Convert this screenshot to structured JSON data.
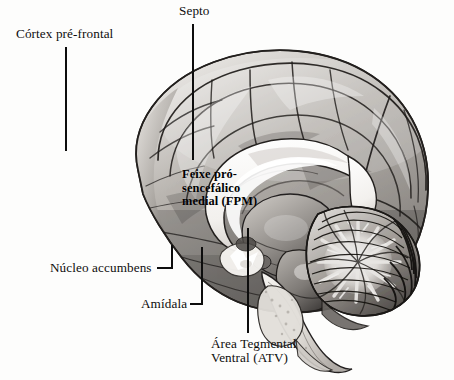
{
  "figure": {
    "type": "anatomical-illustration",
    "language": "pt-BR",
    "background_color": "#fdfdfc",
    "ink_color": "#0d0d0d",
    "style": "grayscale halftone engraving"
  },
  "annotations": [
    {
      "id": "cortex-pre-frontal",
      "text": "Córtex pré-frontal",
      "label_x": 16,
      "label_y": 27,
      "align": "left",
      "overlay": false,
      "leader": {
        "type": "vertical",
        "x": 66,
        "y1": 47,
        "y2": 151
      }
    },
    {
      "id": "septo",
      "text": "Septo",
      "label_x": 179,
      "label_y": 4,
      "align": "left",
      "overlay": false,
      "leader": {
        "type": "vertical",
        "x": 193,
        "y1": 24,
        "y2": 160
      }
    },
    {
      "id": "feixe-prosencefalico-medial",
      "text": "Feixe pró-\nsencefálico\nmedial (FPM)",
      "label_x": 182,
      "label_y": 168,
      "align": "left",
      "overlay": true,
      "leader": null
    },
    {
      "id": "nucleo-accumbens",
      "text": "Núcleo accumbens",
      "label_x": 50,
      "label_y": 261,
      "align": "left",
      "overlay": false,
      "leader": {
        "type": "elbow",
        "x1": 157,
        "y1": 268,
        "x2": 172,
        "y2": 268,
        "y3": 245
      }
    },
    {
      "id": "amidala",
      "text": "Amídala",
      "label_x": 141,
      "label_y": 297,
      "align": "left",
      "overlay": false,
      "leader": {
        "type": "elbow",
        "x1": 190,
        "y1": 304,
        "x2": 202,
        "y2": 304,
        "y3": 247
      }
    },
    {
      "id": "area-tegmental-ventral",
      "text": "Área Tegmental\nVentral (ATV)",
      "label_x": 211,
      "label_y": 337,
      "align": "left",
      "overlay": false,
      "leader": {
        "type": "vertical",
        "x": 248,
        "y1": 228,
        "y2": 333
      }
    }
  ]
}
